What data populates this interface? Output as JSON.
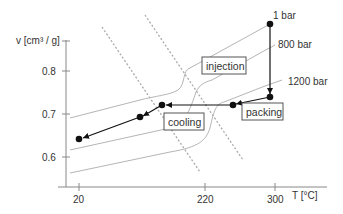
{
  "diagram": {
    "y_axis": {
      "label": "v [cm³ / g]",
      "ticks": [
        "0.8",
        "0.7",
        "0.6"
      ]
    },
    "x_axis": {
      "label": "T [°C]",
      "ticks": [
        "20",
        "220",
        "300"
      ]
    },
    "isobars": [
      {
        "label": "1 bar"
      },
      {
        "label": "800 bar"
      },
      {
        "label": "1200 bar"
      }
    ],
    "phases": {
      "injection": "injection",
      "packing": "packing",
      "cooling": "cooling"
    },
    "colors": {
      "process_line": "#111111",
      "isobar": "#b5b5b5",
      "dashed": "#aaaaaa",
      "axis": "#888888",
      "text": "#333333"
    }
  }
}
